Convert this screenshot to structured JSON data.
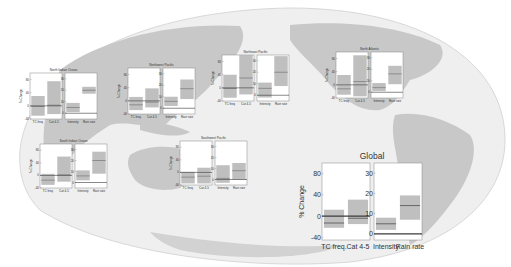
{
  "figure": {
    "background_map": "world-map-globe",
    "colors": {
      "ocean": "#efefef",
      "land": "#c8c8c8",
      "box_fill": "#b4b4b4",
      "median": "#6a6a6a",
      "zero_line": "#3a3a3a",
      "panel_bg": "#ffffff",
      "axis": "#888888",
      "text": "#333333"
    }
  },
  "chart_data": [
    {
      "type": "box",
      "title": "North Indian Ocean",
      "left": {
        "ylabel": "% Change",
        "ylim": [
          -40,
          100
        ],
        "ticks": [
          -40,
          0,
          40,
          80
        ],
        "categories": [
          "TC freq.",
          "Cat 4-5"
        ],
        "boxes": [
          {
            "low": -30,
            "high": 30,
            "median": -2
          },
          {
            "low": -25,
            "high": 75,
            "median": 2
          }
        ]
      },
      "right": {
        "ylim": [
          -5,
          35
        ],
        "ticks": [
          0,
          10,
          20,
          30
        ],
        "categories": [
          "Intensity",
          "Rain rate"
        ],
        "boxes": [
          {
            "low": 1,
            "high": 9,
            "median": 5
          },
          {
            "low": 17,
            "high": 23,
            "median": 20
          }
        ]
      }
    },
    {
      "type": "box",
      "title": "Northwest Pacific",
      "left": {
        "ylabel": "% Change",
        "ylim": [
          -40,
          100
        ],
        "ticks": [
          -40,
          0,
          40,
          80
        ],
        "categories": [
          "TC freq.",
          "Cat 4-5"
        ],
        "boxes": [
          {
            "low": -28,
            "high": 12,
            "median": -12
          },
          {
            "low": -20,
            "high": 38,
            "median": -4
          }
        ]
      },
      "right": {
        "ylim": [
          -5,
          35
        ],
        "ticks": [
          0,
          10,
          20,
          30
        ],
        "categories": [
          "Intensity",
          "Rain rate"
        ],
        "boxes": [
          {
            "low": 2,
            "high": 10,
            "median": 6
          },
          {
            "low": 8,
            "high": 25,
            "median": 17
          }
        ]
      }
    },
    {
      "type": "box",
      "title": "Northeast Pacific",
      "left": {
        "ylabel": "% Change",
        "ylim": [
          -40,
          100
        ],
        "ticks": [
          -40,
          0,
          40,
          80
        ],
        "categories": [
          "TC freq.",
          "Cat 4-5"
        ],
        "boxes": [
          {
            "low": -30,
            "high": 40,
            "median": -2
          },
          {
            "low": -20,
            "high": 100,
            "median": 30
          }
        ]
      },
      "right": {
        "ylim": [
          -5,
          35
        ],
        "ticks": [
          0,
          10,
          20,
          30
        ],
        "categories": [
          "Intensity",
          "Rain rate"
        ],
        "boxes": [
          {
            "low": -2,
            "high": 11,
            "median": 6
          },
          {
            "low": 8,
            "high": 34,
            "median": 20
          }
        ]
      }
    },
    {
      "type": "box",
      "title": "North Atlantic",
      "left": {
        "ylabel": "% Change",
        "ylim": [
          -40,
          100
        ],
        "ticks": [
          -40,
          0,
          40,
          80
        ],
        "categories": [
          "TC freq.",
          "Cat 4-5"
        ],
        "boxes": [
          {
            "low": -30,
            "high": 30,
            "median": -12
          },
          {
            "low": -35,
            "high": 90,
            "median": 10
          }
        ]
      },
      "right": {
        "ylim": [
          -5,
          35
        ],
        "ticks": [
          0,
          10,
          20,
          30
        ],
        "categories": [
          "Intensity",
          "Rain rate"
        ],
        "boxes": [
          {
            "low": 1,
            "high": 8,
            "median": 4
          },
          {
            "low": 7,
            "high": 23,
            "median": 16
          }
        ]
      }
    },
    {
      "type": "box",
      "title": "South Indian Ocean",
      "left": {
        "ylabel": "% Change",
        "ylim": [
          -40,
          100
        ],
        "ticks": [
          -40,
          0,
          40,
          80
        ],
        "categories": [
          "TC freq.",
          "Cat 4-5"
        ],
        "boxes": [
          {
            "low": -30,
            "high": 5,
            "median": -15
          },
          {
            "low": -20,
            "high": 60,
            "median": 2
          }
        ]
      },
      "right": {
        "ylim": [
          -5,
          35
        ],
        "ticks": [
          0,
          10,
          20,
          30
        ],
        "categories": [
          "Intensity",
          "Rain rate"
        ],
        "boxes": [
          {
            "low": 2,
            "high": 11,
            "median": 6
          },
          {
            "low": 8,
            "high": 28,
            "median": 20
          }
        ]
      }
    },
    {
      "type": "box",
      "title": "Southwest Pacific",
      "left": {
        "ylabel": "% Change",
        "ylim": [
          -40,
          100
        ],
        "ticks": [
          -40,
          0,
          40,
          80
        ],
        "categories": [
          "TC freq.",
          "Cat 4-5"
        ],
        "boxes": [
          {
            "low": -35,
            "high": 2,
            "median": -15
          },
          {
            "low": -35,
            "high": 15,
            "median": -12
          }
        ]
      },
      "right": {
        "ylim": [
          -5,
          35
        ],
        "ticks": [
          0,
          10,
          20,
          30
        ],
        "categories": [
          "Intensity",
          "Rain rate"
        ],
        "boxes": [
          {
            "low": -3,
            "high": 13,
            "median": 1
          },
          {
            "low": 0,
            "high": 15,
            "median": 8
          }
        ]
      }
    },
    {
      "type": "box",
      "title": "Global",
      "left": {
        "ylabel": "% Change",
        "ylim": [
          -45,
          100
        ],
        "ticks": [
          -40,
          0,
          40,
          80
        ],
        "categories": [
          "TC freq.",
          "Cat 4-5"
        ],
        "boxes": [
          {
            "low": -22,
            "high": 12,
            "median": -13
          },
          {
            "low": -15,
            "high": 31,
            "median": -4
          }
        ]
      },
      "right": {
        "ylim": [
          -3,
          35
        ],
        "ticks": [
          0,
          10,
          20,
          30
        ],
        "categories": [
          "Intensity",
          "Rain rate"
        ],
        "boxes": [
          {
            "low": 2,
            "high": 8,
            "median": 5
          },
          {
            "low": 7,
            "high": 19,
            "median": 14
          }
        ]
      }
    }
  ]
}
